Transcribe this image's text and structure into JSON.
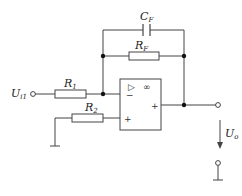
{
  "diagram": {
    "type": "op-amp circuit",
    "components": {
      "capacitor_feedback": {
        "label": "C",
        "sub": "F"
      },
      "resistor_feedback": {
        "label": "R",
        "sub": "F"
      },
      "resistor_1": {
        "label": "R",
        "sub": "1"
      },
      "resistor_2": {
        "label": "R",
        "sub": "2"
      },
      "input": {
        "label": "U",
        "sub": "i1"
      },
      "output": {
        "label": "U",
        "sub": "o"
      },
      "opamp": {
        "triangle": "▷",
        "gain": "∞",
        "inv": "−",
        "noninv": "+",
        "out": "+"
      }
    }
  }
}
